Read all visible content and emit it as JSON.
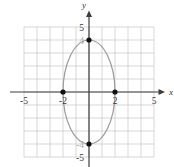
{
  "figure": {
    "width": 174,
    "height": 167,
    "background": "#ffffff"
  },
  "chart_data": {
    "type": "line",
    "title": "",
    "xlabel": "x",
    "ylabel": "y",
    "xlim": [
      -5,
      5
    ],
    "ylim": [
      -5,
      5
    ],
    "grid": true,
    "grid_step": 1,
    "ellipse": {
      "cx": 0,
      "cy": 0,
      "rx": 2,
      "ry": 4
    },
    "points": [
      {
        "x": -2,
        "y": 0
      },
      {
        "x": 2,
        "y": 0
      },
      {
        "x": 0,
        "y": 4
      },
      {
        "x": 0,
        "y": -4
      }
    ],
    "x_ticks": [
      {
        "value": -5,
        "label": "-5",
        "color": "#3a3a3a"
      },
      {
        "value": -2,
        "label": "-2",
        "color": "#3a3a3a"
      },
      {
        "value": 2,
        "label": "2",
        "color": "#3a3a3a"
      },
      {
        "value": 5,
        "label": "5",
        "color": "#3a3a3a"
      }
    ],
    "y_ticks": [
      {
        "value": 5,
        "label": "5",
        "color": "#3a3a3a"
      },
      {
        "value": 4,
        "label": "4",
        "color": "#aaaaaa"
      },
      {
        "value": -4,
        "label": "-4",
        "color": "#aaaaaa"
      },
      {
        "value": -5,
        "label": "-5",
        "color": "#3a3a3a"
      }
    ],
    "colors": {
      "grid": "#c6c6c6",
      "axis": "#3d3d3d",
      "ellipse": "#9a9a9a",
      "point": "#111111",
      "axis_label": "#333333"
    },
    "legend": null
  }
}
